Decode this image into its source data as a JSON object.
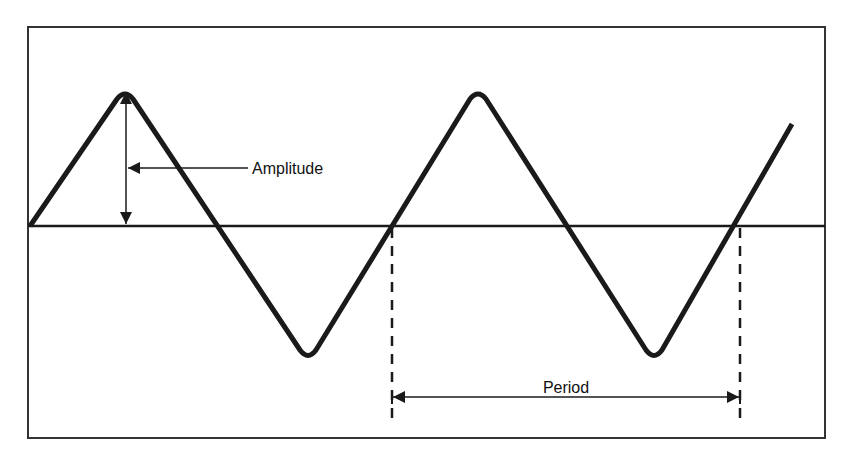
{
  "diagram": {
    "labels": {
      "amplitude": "Amplitude",
      "period": "Period"
    },
    "colors": {
      "background": "#ffffff",
      "stroke": "#1a1a1a"
    },
    "frame": {
      "x": 28,
      "y": 27,
      "width": 797,
      "height": 411
    },
    "baseline_y": 226,
    "waveform": {
      "type": "rounded-triangle",
      "points": [
        [
          30,
          226
        ],
        [
          125,
          90
        ],
        [
          213,
          226
        ],
        [
          308,
          359
        ],
        [
          392,
          226
        ],
        [
          478,
          90
        ],
        [
          566,
          226
        ],
        [
          654,
          359
        ],
        [
          738,
          226
        ],
        [
          792,
          124
        ]
      ]
    },
    "amplitude_marker": {
      "x": 126,
      "y_top": 92,
      "y_bottom": 224,
      "leader_y": 168,
      "leader_end_x": 248
    },
    "period_marker": {
      "x_start": 392,
      "x_end": 740,
      "y": 397,
      "dash_bottom": 426
    }
  }
}
